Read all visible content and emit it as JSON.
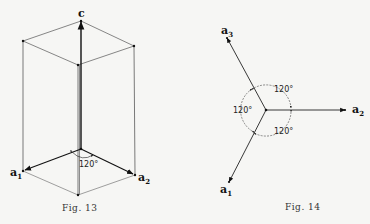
{
  "figures": [
    {
      "id": "fig13",
      "caption": "Fig. 13",
      "vector_labels": {
        "c": "c",
        "a1": "a",
        "a1_sub": "1",
        "a2": "a",
        "a2_sub": "2"
      },
      "angle_label": "120°"
    },
    {
      "id": "fig14",
      "caption": "Fig. 14",
      "vector_labels": {
        "a1": "a",
        "a1_sub": "1",
        "a2": "a",
        "a2_sub": "2",
        "a3": "a",
        "a3_sub": "3"
      },
      "angle_labels": [
        "120°",
        "120°",
        "120°"
      ]
    }
  ]
}
